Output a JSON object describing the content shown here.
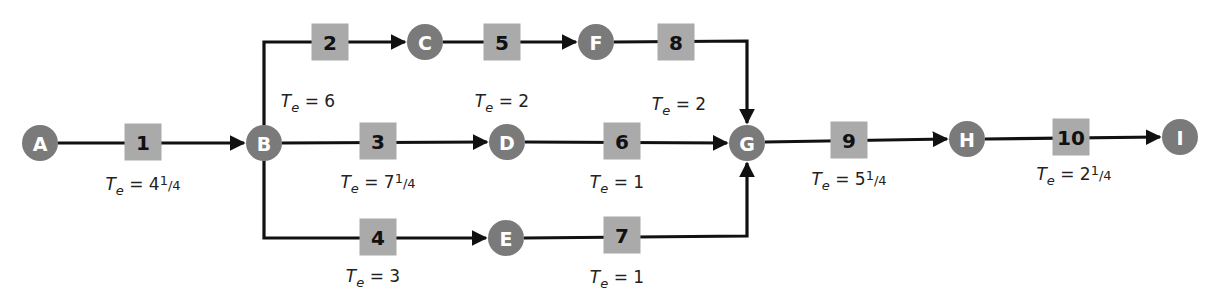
{
  "colors": {
    "node": "#7a7a7a",
    "activity_box": "#aaaaaa",
    "line": "#111111"
  },
  "te_prefix": "T",
  "te_subscript": "e",
  "nodes": [
    {
      "id": "A",
      "label": "A"
    },
    {
      "id": "B",
      "label": "B"
    },
    {
      "id": "C",
      "label": "C"
    },
    {
      "id": "D",
      "label": "D"
    },
    {
      "id": "E",
      "label": "E"
    },
    {
      "id": "F",
      "label": "F"
    },
    {
      "id": "G",
      "label": "G"
    },
    {
      "id": "H",
      "label": "H"
    },
    {
      "id": "I",
      "label": "I"
    }
  ],
  "activities": [
    {
      "id": "1",
      "label": "1",
      "from": "A",
      "to": "B",
      "te_whole": "4",
      "te_frac": "1/4",
      "te_value": 4.25
    },
    {
      "id": "2",
      "label": "2",
      "from": "B",
      "to": "C",
      "te_whole": "6",
      "te_frac": "",
      "te_value": 6
    },
    {
      "id": "3",
      "label": "3",
      "from": "B",
      "to": "D",
      "te_whole": "7",
      "te_frac": "1/4",
      "te_value": 7.25
    },
    {
      "id": "4",
      "label": "4",
      "from": "B",
      "to": "E",
      "te_whole": "3",
      "te_frac": "",
      "te_value": 3
    },
    {
      "id": "5",
      "label": "5",
      "from": "C",
      "to": "F",
      "te_whole": "2",
      "te_frac": "",
      "te_value": 2
    },
    {
      "id": "6",
      "label": "6",
      "from": "D",
      "to": "G",
      "te_whole": "1",
      "te_frac": "",
      "te_value": 1
    },
    {
      "id": "7",
      "label": "7",
      "from": "E",
      "to": "G",
      "te_whole": "1",
      "te_frac": "",
      "te_value": 1
    },
    {
      "id": "8",
      "label": "8",
      "from": "F",
      "to": "G",
      "te_whole": "2",
      "te_frac": "",
      "te_value": 2
    },
    {
      "id": "9",
      "label": "9",
      "from": "G",
      "to": "H",
      "te_whole": "5",
      "te_frac": "1/4",
      "te_value": 5.25
    },
    {
      "id": "10",
      "label": "10",
      "from": "H",
      "to": "I",
      "te_whole": "2",
      "te_frac": "1/4",
      "te_value": 2.25
    }
  ]
}
